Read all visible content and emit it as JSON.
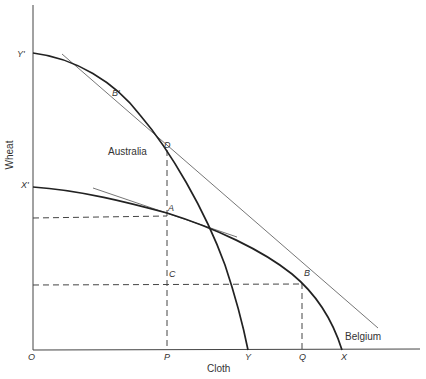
{
  "axes": {
    "x_title": "Cloth",
    "y_title": "Wheat",
    "origin": "O"
  },
  "curves": {
    "australia": {
      "name": "Australia",
      "y_intercept": "Y'",
      "x_intercept": "Y"
    },
    "belgium": {
      "name": "Belgium",
      "y_intercept": "X'",
      "x_intercept": "X"
    }
  },
  "points": {
    "A": "A",
    "B": "B",
    "B_prime": "B'",
    "C": "C",
    "D": "D",
    "P": "P",
    "Q": "Q"
  },
  "colors": {
    "curve": "#222222",
    "axis": "#444444",
    "tangent": "#666666",
    "dash": "#444444",
    "text": "#333333"
  }
}
